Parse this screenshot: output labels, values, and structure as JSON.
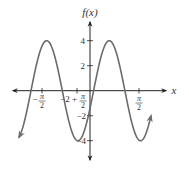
{
  "chart_data": {
    "type": "line",
    "title": "",
    "xlabel": "x",
    "ylabel": "f(x)",
    "function": "sinusoid, amplitude 4",
    "amplitude": 4,
    "x_ticks": [
      {
        "label_num": "π",
        "label_den": "2",
        "sign": "−",
        "value": -1.5708
      },
      {
        "label_prefix": "−2 + ",
        "label_num": "π",
        "label_den": "2",
        "value": -0.4292
      },
      {
        "label_num": "π",
        "label_den": "2",
        "sign": "",
        "value": 1.5708
      }
    ],
    "y_ticks": [
      {
        "label": "4",
        "value": 4
      },
      {
        "label": "2",
        "value": 2
      },
      {
        "label": "−2",
        "value": -2
      },
      {
        "label": "−4",
        "value": -4
      }
    ],
    "ylim": [
      -5.5,
      5.5
    ],
    "series": [
      {
        "name": "f(x)",
        "color": "#6b6b6b",
        "points_px_note": "peaks at y=4, troughs at y=-4, both ends arrowed",
        "x": [
          -2.3,
          -1.9,
          -1.4,
          -0.9,
          -0.4,
          0.1,
          0.6,
          1.1,
          1.6,
          1.95
        ],
        "y": [
          -3.8,
          0,
          4,
          0,
          -4,
          0.5,
          4,
          0,
          -4,
          -2.5
        ]
      }
    ],
    "grid": false,
    "legend": null
  },
  "labels": {
    "y_axis": "f(x)",
    "x_axis": "x",
    "y4": "4",
    "y2": "2",
    "yneg2": "−2",
    "yneg4": "−4",
    "xt1_sign": "−",
    "xt1_num": "π",
    "xt1_den": "2",
    "xt2_prefix": "−2 +",
    "xt2_num": "π",
    "xt2_den": "2",
    "xt3_num": "π",
    "xt3_den": "2"
  },
  "colors": {
    "axis": "#222222",
    "curve": "#6b6b6b"
  }
}
